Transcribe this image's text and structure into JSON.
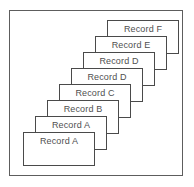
{
  "diagram": {
    "type": "stacked-cards",
    "frame": {
      "border_color": "#5d5d5d",
      "background_color": "#ffffff"
    },
    "card_style": {
      "border_color": "#4a4a4a",
      "background_color": "#ffffff",
      "text_color": "#4f4f4f",
      "width": 72,
      "height": 34
    },
    "layout": {
      "offset_x": 12,
      "offset_y": 16,
      "base_left": 13,
      "base_top": 121
    },
    "cards": [
      {
        "label": "Record A",
        "index": 0,
        "left": 13,
        "top": 121
      },
      {
        "label": "Record A",
        "index": 1,
        "left": 25,
        "top": 105
      },
      {
        "label": "Record B",
        "index": 2,
        "left": 37,
        "top": 89
      },
      {
        "label": "Record C",
        "index": 3,
        "left": 49,
        "top": 73
      },
      {
        "label": "Record D",
        "index": 4,
        "left": 61,
        "top": 57
      },
      {
        "label": "Record D",
        "index": 5,
        "left": 73,
        "top": 41
      },
      {
        "label": "Record E",
        "index": 6,
        "left": 85,
        "top": 25
      },
      {
        "label": "Record F",
        "index": 7,
        "left": 97,
        "top": 9
      }
    ]
  }
}
